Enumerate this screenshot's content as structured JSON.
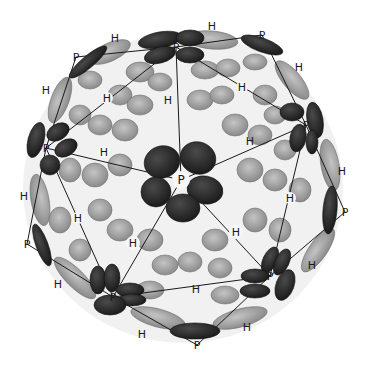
{
  "figure": {
    "colors": {
      "background": "#ffffff",
      "pentamer_fill": "#2b2b2b",
      "hexamer_fill": "#9a9a9a",
      "hexamer_light": "#b8b8b8",
      "gap_fill": "#f4f4f4",
      "lattice_line": "#1a1a1a",
      "label_text": "#1a1a1a"
    },
    "legend_symbols": {
      "pentamer": "P",
      "hexamer": "H"
    },
    "labels": [
      {
        "text": "P",
        "x": 181,
        "y": 180,
        "type": "pentamer",
        "role": "center"
      },
      {
        "text": "P",
        "x": 176,
        "y": 47,
        "type": "pentamer"
      },
      {
        "text": "P",
        "x": 262,
        "y": 35,
        "type": "pentamer"
      },
      {
        "text": "P",
        "x": 76,
        "y": 57,
        "type": "pentamer"
      },
      {
        "text": "P",
        "x": 46,
        "y": 148,
        "type": "pentamer"
      },
      {
        "text": "P",
        "x": 306,
        "y": 125,
        "type": "pentamer"
      },
      {
        "text": "P",
        "x": 27,
        "y": 244,
        "type": "pentamer"
      },
      {
        "text": "P",
        "x": 345,
        "y": 212,
        "type": "pentamer"
      },
      {
        "text": "P",
        "x": 270,
        "y": 276,
        "type": "pentamer"
      },
      {
        "text": "P",
        "x": 113,
        "y": 297,
        "type": "pentamer"
      },
      {
        "text": "P",
        "x": 197,
        "y": 345,
        "type": "pentamer"
      },
      {
        "text": "H",
        "x": 115,
        "y": 38,
        "type": "hexamer"
      },
      {
        "text": "H",
        "x": 212,
        "y": 26,
        "type": "hexamer"
      },
      {
        "text": "H",
        "x": 46,
        "y": 90,
        "type": "hexamer"
      },
      {
        "text": "H",
        "x": 107,
        "y": 98,
        "type": "hexamer"
      },
      {
        "text": "H",
        "x": 168,
        "y": 100,
        "type": "hexamer"
      },
      {
        "text": "H",
        "x": 242,
        "y": 87,
        "type": "hexamer"
      },
      {
        "text": "H",
        "x": 299,
        "y": 67,
        "type": "hexamer"
      },
      {
        "text": "H",
        "x": 104,
        "y": 152,
        "type": "hexamer"
      },
      {
        "text": "H",
        "x": 250,
        "y": 141,
        "type": "hexamer"
      },
      {
        "text": "H",
        "x": 342,
        "y": 171,
        "type": "hexamer"
      },
      {
        "text": "H",
        "x": 24,
        "y": 196,
        "type": "hexamer"
      },
      {
        "text": "H",
        "x": 78,
        "y": 218,
        "type": "hexamer"
      },
      {
        "text": "H",
        "x": 290,
        "y": 198,
        "type": "hexamer"
      },
      {
        "text": "H",
        "x": 133,
        "y": 243,
        "type": "hexamer"
      },
      {
        "text": "H",
        "x": 236,
        "y": 232,
        "type": "hexamer"
      },
      {
        "text": "H",
        "x": 58,
        "y": 284,
        "type": "hexamer"
      },
      {
        "text": "H",
        "x": 312,
        "y": 265,
        "type": "hexamer"
      },
      {
        "text": "H",
        "x": 196,
        "y": 289,
        "type": "hexamer"
      },
      {
        "text": "H",
        "x": 142,
        "y": 334,
        "type": "hexamer"
      },
      {
        "text": "H",
        "x": 247,
        "y": 327,
        "type": "hexamer"
      }
    ]
  }
}
